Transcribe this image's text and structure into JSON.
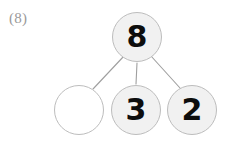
{
  "problem": {
    "label": "(8)",
    "type": "number-bond"
  },
  "diagram": {
    "whole": {
      "value": "8",
      "filled": true
    },
    "parts": [
      {
        "value": "",
        "filled": false,
        "blank": true
      },
      {
        "value": "3",
        "filled": true,
        "blank": false
      },
      {
        "value": "2",
        "filled": true,
        "blank": false
      }
    ],
    "colors": {
      "circle_fill": "#f1f1f1",
      "circle_border": "#bdbdbd",
      "empty_circle_fill": "#ffffff",
      "digit": "#0d0d0d",
      "line": "#9f9f9f",
      "label": "#9a9a9a",
      "background": "#ffffff"
    },
    "connectors": [
      {
        "name": "whole-to-part-1",
        "x1": 124,
        "y1": 56,
        "x2": 93,
        "y2": 89
      },
      {
        "name": "whole-to-part-2",
        "x1": 137,
        "y1": 63,
        "x2": 136,
        "y2": 84
      },
      {
        "name": "whole-to-part-3",
        "x1": 151,
        "y1": 56,
        "x2": 180,
        "y2": 88
      }
    ]
  }
}
